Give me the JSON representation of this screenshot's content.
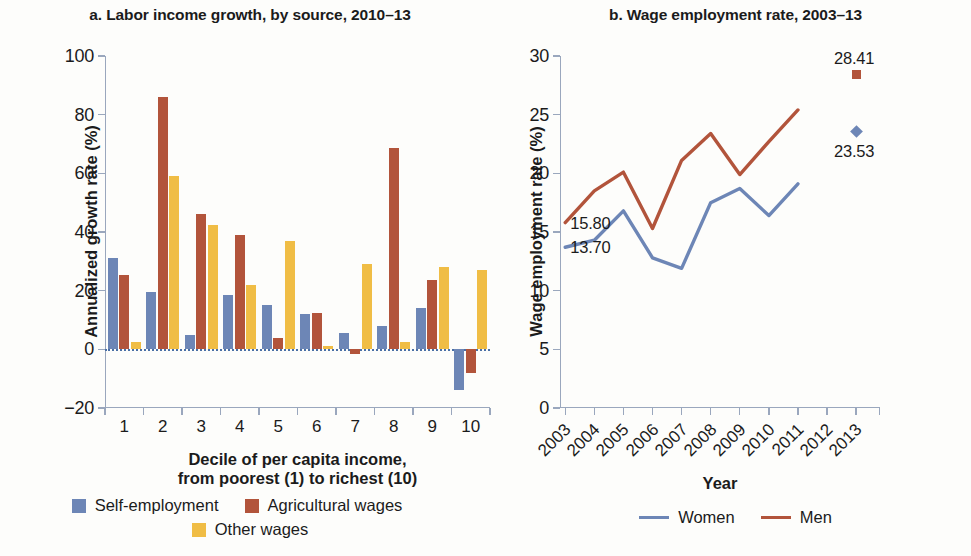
{
  "figure": {
    "panel_a": {
      "title": "a. Labor income growth, by source, 2010–13",
      "y_axis_title": "Annualized growth rate (%)",
      "x_axis_title_line1": "Decile of per capita income,",
      "x_axis_title_line2": "from poorest (1) to richest (10)",
      "y_ticks": [
        "100",
        "80",
        "60",
        "40",
        "20",
        "0",
        "−20"
      ],
      "x_ticks": [
        "1",
        "2",
        "3",
        "4",
        "5",
        "6",
        "7",
        "8",
        "9",
        "10"
      ],
      "legend": [
        {
          "label": "Self-employment",
          "color": "#6d86b6",
          "swatch": "blue"
        },
        {
          "label": "Agricultural wages",
          "color": "#b2543b",
          "swatch": "red"
        },
        {
          "label": "Other wages",
          "color": "#f0bd45",
          "swatch": "yellow"
        }
      ]
    },
    "panel_b": {
      "title": "b. Wage employment rate, 2003–13",
      "y_axis_title": "Wage employment rate (%)",
      "x_axis_title": "Year",
      "y_ticks": [
        "30",
        "25",
        "20",
        "15",
        "10",
        "5",
        "0"
      ],
      "x_ticks": [
        "2003",
        "2004",
        "2005",
        "2006",
        "2007",
        "2008",
        "2009",
        "2010",
        "2011",
        "2012",
        "2013"
      ],
      "start_label_men": "15.80",
      "start_label_women": "13.70",
      "end_label_men": "28.41",
      "end_label_women": "23.53",
      "legend": [
        {
          "label": "Women",
          "color": "#6d86b6",
          "swatch": "blue"
        },
        {
          "label": "Men",
          "color": "#b2543b",
          "swatch": "red"
        }
      ]
    }
  },
  "chart_data": [
    {
      "type": "bar",
      "panel": "a",
      "title": "a. Labor income growth, by source, 2010–13",
      "xlabel": "Decile of per capita income, from poorest (1) to richest (10)",
      "ylabel": "Annualized growth rate (%)",
      "categories": [
        "1",
        "2",
        "3",
        "4",
        "5",
        "6",
        "7",
        "8",
        "9",
        "10"
      ],
      "ylim": [
        -20,
        100
      ],
      "yticks": [
        -20,
        0,
        20,
        40,
        60,
        80,
        100
      ],
      "grid": false,
      "legend_position": "bottom",
      "zero_baseline": true,
      "series": [
        {
          "name": "Self-employment",
          "color": "#6d86b6",
          "values": [
            31.0,
            19.5,
            5.0,
            18.5,
            15.0,
            12.0,
            5.5,
            8.0,
            14.0,
            -14.0
          ]
        },
        {
          "name": "Agricultural wages",
          "color": "#b2543b",
          "values": [
            25.5,
            86.0,
            46.0,
            39.0,
            4.0,
            12.5,
            -1.5,
            68.5,
            23.5,
            -8.0
          ]
        },
        {
          "name": "Other wages",
          "color": "#f0bd45",
          "values": [
            2.5,
            59.0,
            42.5,
            22.0,
            37.0,
            1.0,
            29.0,
            2.5,
            28.0,
            27.0
          ]
        }
      ]
    },
    {
      "type": "line",
      "panel": "b",
      "title": "b. Wage employment rate, 2003–13",
      "xlabel": "Year",
      "ylabel": "Wage employment rate (%)",
      "x": [
        2003,
        2004,
        2005,
        2006,
        2007,
        2008,
        2009,
        2010,
        2011,
        2012,
        2013
      ],
      "ylim": [
        0,
        30
      ],
      "yticks": [
        0,
        5,
        10,
        15,
        20,
        25,
        30
      ],
      "grid": false,
      "legend_position": "bottom",
      "series": [
        {
          "name": "Women",
          "color": "#6d86b6",
          "x": [
            2003,
            2004,
            2005,
            2006,
            2007,
            2008,
            2009,
            2010,
            2011
          ],
          "values": [
            13.7,
            14.3,
            16.8,
            12.8,
            11.9,
            17.5,
            18.7,
            16.4,
            19.1
          ],
          "marker_points": [
            {
              "x": 2013,
              "y": 23.53,
              "shape": "diamond",
              "label": "23.53"
            }
          ],
          "start_label": "13.70"
        },
        {
          "name": "Men",
          "color": "#b2543b",
          "x": [
            2003,
            2004,
            2005,
            2006,
            2007,
            2008,
            2009,
            2010,
            2011
          ],
          "values": [
            15.8,
            18.5,
            20.1,
            15.3,
            21.1,
            23.4,
            19.9,
            22.7,
            25.4
          ],
          "marker_points": [
            {
              "x": 2013,
              "y": 28.41,
              "shape": "square",
              "label": "28.41"
            }
          ],
          "start_label": "15.80"
        }
      ]
    }
  ]
}
